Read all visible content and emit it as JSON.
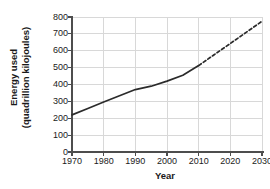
{
  "chart_data": {
    "type": "line",
    "title": "",
    "xlabel": "Year",
    "ylabel": "Energy used (quadrillion kilojoules)",
    "ylabel_line1": "Energy used",
    "ylabel_line2": "(quadrillion kilojoules)",
    "xlim": [
      1970,
      2030
    ],
    "ylim": [
      0,
      800
    ],
    "xticks": [
      1970,
      1980,
      1990,
      2000,
      2010,
      2020,
      2030
    ],
    "xtick_labels": [
      "1970",
      "1980",
      "1990",
      "2000",
      "2010",
      "2020",
      "2030"
    ],
    "yticks": [
      0,
      100,
      200,
      300,
      400,
      500,
      600,
      700,
      800
    ],
    "ytick_labels": [
      "0",
      "100",
      "200",
      "300",
      "400",
      "500",
      "600",
      "700",
      "800"
    ],
    "grid": true,
    "legend": null,
    "series": [
      {
        "name": "Energy used (historical)",
        "style": "solid",
        "color": "#2b2b2b",
        "x": [
          1970,
          1975,
          1980,
          1985,
          1990,
          1995,
          2000,
          2005,
          2010
        ],
        "values": [
          220,
          258,
          296,
          333,
          370,
          390,
          420,
          455,
          512
        ]
      },
      {
        "name": "Energy used (projected)",
        "style": "dashed",
        "color": "#2b2b2b",
        "x": [
          2010,
          2015,
          2020,
          2025,
          2030
        ],
        "values": [
          512,
          578,
          643,
          709,
          775
        ]
      }
    ]
  },
  "colors": {
    "background": "#ffffff",
    "axis": "#4d4d4d",
    "grid": "#d8d8d8",
    "line": "#2b2b2b",
    "text": "#1a1a1a"
  }
}
